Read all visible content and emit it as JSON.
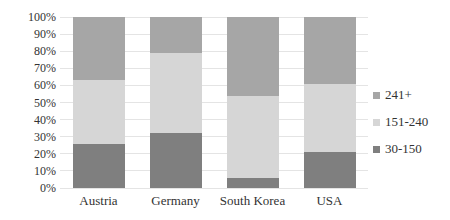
{
  "chart_data": {
    "type": "bar",
    "subtype": "stacked-100-percent",
    "orientation": "vertical",
    "title": "",
    "xlabel": "",
    "ylabel": "",
    "categories": [
      "Austria",
      "Germany",
      "South Korea",
      "USA"
    ],
    "series": [
      {
        "name": "30-150",
        "color": "#7f7f7f",
        "values": [
          26,
          32,
          6,
          21
        ]
      },
      {
        "name": "151-240",
        "color": "#d6d6d6",
        "values": [
          37,
          47,
          48,
          40
        ]
      },
      {
        "name": "241+",
        "color": "#a6a6a6",
        "values": [
          37,
          21,
          46,
          39
        ]
      }
    ],
    "y_axis": {
      "min": 0,
      "max": 100,
      "tick_step": 10,
      "tick_labels": [
        "0%",
        "10%",
        "20%",
        "30%",
        "40%",
        "50%",
        "60%",
        "70%",
        "80%",
        "90%",
        "100%"
      ]
    },
    "grid": true,
    "legend": {
      "position": "right",
      "entries_top_to_bottom": [
        "241+",
        "151-240",
        "30-150"
      ]
    }
  },
  "colors": {
    "background": "#ffffff",
    "gridline": "#e4e4e4",
    "text": "#333333"
  }
}
